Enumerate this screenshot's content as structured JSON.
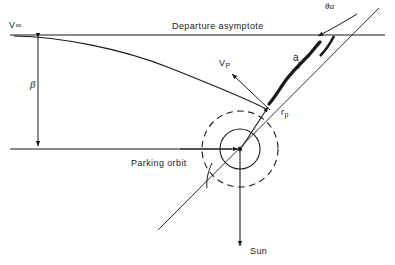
{
  "figure": {
    "background_color": "#ffffff",
    "line_color": "#1a1a1a"
  },
  "labels": {
    "v_infinity": "V",
    "v_infinity_sub": "∞",
    "beta": "β",
    "departure_asymptote": "Departure asymptote",
    "theta_a": "θa",
    "semi_major_axis": "a",
    "v_periapsis": "V",
    "v_periapsis_sub": "P",
    "r_periapsis": "r",
    "r_periapsis_sub": "p",
    "parking_orbit": "Parking orbit",
    "sun": "Sun"
  },
  "geometry": {
    "asymptote_line": {
      "x1": 10,
      "y1": 35,
      "x2": 385,
      "y2": 35
    },
    "reference_line": {
      "x1": 10,
      "y1": 149,
      "x2": 240,
      "y2": 149
    },
    "beta_arrow": {
      "x": 38,
      "y_top": 35,
      "y_bottom": 149
    },
    "apse_line": {
      "x1": 158,
      "y1": 230,
      "x2": 379,
      "y2": 8
    },
    "center": {
      "x": 240,
      "y": 149
    },
    "earth_radius": 20,
    "parking_orbit_radius": 38,
    "periapsis": {
      "x": 271,
      "y": 104
    },
    "sun_arrow": {
      "x": 240,
      "y_from": 149,
      "y_to": 248
    },
    "semi_major_segment": {
      "x1": 272,
      "y1": 100,
      "x2": 318,
      "y2": 48
    }
  }
}
